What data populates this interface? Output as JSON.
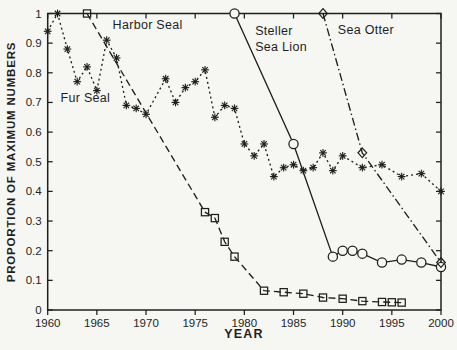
{
  "figure": {
    "background": "#f6f6f3",
    "ink": "#1f1f1f"
  },
  "chart_data": {
    "type": "line",
    "title": "",
    "xlabel": "YEAR",
    "ylabel": "PROPORTION OF MAXIMUM NUMBERS",
    "xlim": [
      1960,
      2000
    ],
    "ylim": [
      0,
      1
    ],
    "x_ticks": [
      1960,
      1965,
      1970,
      1975,
      1980,
      1985,
      1990,
      1995,
      2000
    ],
    "y_ticks": [
      0,
      0.1,
      0.2,
      0.3,
      0.4,
      0.5,
      0.6,
      0.7,
      0.8,
      0.9,
      1
    ],
    "y_tick_labels": [
      "0",
      "0.1",
      "0.2",
      "0.3",
      "0.4",
      "0.5",
      "0.6",
      "0.7",
      "0.8",
      "0.9",
      "1"
    ],
    "grid": false,
    "legend_position": "in-plot text annotations",
    "series": [
      {
        "name": "Harbor Seal",
        "marker": "square",
        "line": "dashed",
        "points": [
          [
            1964,
            1.0
          ],
          [
            1976,
            0.33
          ],
          [
            1977,
            0.31
          ],
          [
            1978,
            0.23
          ],
          [
            1979,
            0.18
          ],
          [
            1982,
            0.065
          ],
          [
            1984,
            0.06
          ],
          [
            1986,
            0.055
          ],
          [
            1988,
            0.042
          ],
          [
            1990,
            0.038
          ],
          [
            1992,
            0.03
          ],
          [
            1994,
            0.027
          ],
          [
            1995,
            0.026
          ],
          [
            1996,
            0.025
          ]
        ]
      },
      {
        "name": "Steller Sea Lion",
        "marker": "circle",
        "line": "solid",
        "points": [
          [
            1979,
            1.0
          ],
          [
            1985,
            0.56
          ],
          [
            1989,
            0.18
          ],
          [
            1990,
            0.2
          ],
          [
            1991,
            0.2
          ],
          [
            1992,
            0.19
          ],
          [
            1994,
            0.16
          ],
          [
            1996,
            0.17
          ],
          [
            1998,
            0.16
          ],
          [
            2000,
            0.145
          ]
        ]
      },
      {
        "name": "Sea Otter",
        "marker": "diamond",
        "line": "dashdot",
        "points": [
          [
            1988,
            1.0
          ],
          [
            1992,
            0.53
          ],
          [
            2000,
            0.16
          ]
        ]
      },
      {
        "name": "Fur Seal",
        "marker": "asterisk",
        "line": "dotted",
        "points": [
          [
            1960,
            0.94
          ],
          [
            1961,
            1.0
          ],
          [
            1962,
            0.88
          ],
          [
            1963,
            0.77
          ],
          [
            1964,
            0.82
          ],
          [
            1965,
            0.74
          ],
          [
            1966,
            0.91
          ],
          [
            1967,
            0.85
          ],
          [
            1968,
            0.69
          ],
          [
            1969,
            0.68
          ],
          [
            1970,
            0.66
          ],
          [
            1972,
            0.78
          ],
          [
            1973,
            0.7
          ],
          [
            1974,
            0.75
          ],
          [
            1975,
            0.77
          ],
          [
            1976,
            0.81
          ],
          [
            1977,
            0.65
          ],
          [
            1978,
            0.69
          ],
          [
            1979,
            0.68
          ],
          [
            1980,
            0.56
          ],
          [
            1981,
            0.52
          ],
          [
            1982,
            0.56
          ],
          [
            1983,
            0.45
          ],
          [
            1984,
            0.48
          ],
          [
            1985,
            0.49
          ],
          [
            1986,
            0.47
          ],
          [
            1987,
            0.48
          ],
          [
            1988,
            0.53
          ],
          [
            1989,
            0.47
          ],
          [
            1990,
            0.52
          ],
          [
            1992,
            0.48
          ],
          [
            1994,
            0.49
          ],
          [
            1996,
            0.45
          ],
          [
            1998,
            0.46
          ],
          [
            2000,
            0.4
          ]
        ]
      }
    ],
    "annotations": [
      {
        "text": "Harbor Seal",
        "x": 1966.6,
        "y": 0.948
      },
      {
        "text": "Steller",
        "x": 1981.1,
        "y": 0.927
      },
      {
        "text": "Sea Lion",
        "x": 1981.1,
        "y": 0.873
      },
      {
        "text": "Sea Otter",
        "x": 1989.5,
        "y": 0.932
      },
      {
        "text": "Fur Seal",
        "x": 1961.3,
        "y": 0.703
      }
    ]
  }
}
